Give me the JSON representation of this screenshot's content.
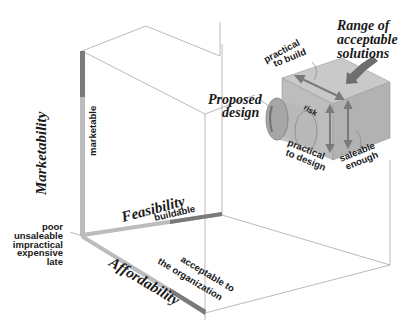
{
  "diagram": {
    "axes": {
      "vertical": {
        "title": "Marketability",
        "target_label": "marketable"
      },
      "depth": {
        "title": "Feasibility",
        "target_label": "buildable"
      },
      "horizontal": {
        "title": "Affordability",
        "target_label_line1": "acceptable to",
        "target_label_line2": "the organization"
      }
    },
    "origin_labels": [
      "poor",
      "unsaleable",
      "impractical",
      "expensive",
      "late"
    ],
    "callouts": {
      "range": {
        "line1": "Range of",
        "line2": "acceptable",
        "line3": "solutions"
      },
      "proposed": {
        "line1": "Proposed",
        "line2": "design"
      },
      "risk": "risk",
      "practical_build": {
        "line1": "practical",
        "line2": "to build"
      },
      "practical_design": {
        "line1": "practical",
        "line2": "to design"
      },
      "saleable": {
        "line1": "saleable",
        "line2": "enough"
      }
    },
    "colors": {
      "axis_light": "#b8b8b8",
      "axis_dark": "#7a7a7a",
      "box_front": "#bdbdbd",
      "box_top": "#c9c9c9",
      "box_side": "#a9a9a9",
      "arrow": "#8a8a8a",
      "edge": "#a8a8a8"
    }
  }
}
